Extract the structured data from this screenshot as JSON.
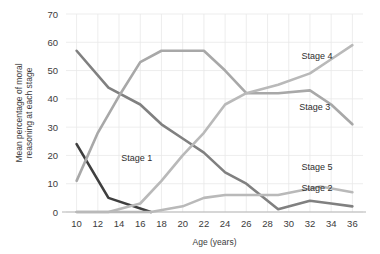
{
  "chart_data": {
    "type": "line",
    "title": "",
    "xlabel": "Age (years)",
    "ylabel": "Mean percentage of moral reasoning at each stage",
    "ylabel_line1": "Mean percentage of moral",
    "ylabel_line2": "reasoning at each stage",
    "x": [
      10,
      12,
      14,
      16,
      18,
      20,
      22,
      24,
      26,
      28,
      30,
      32,
      34,
      36
    ],
    "xlim": [
      9,
      37
    ],
    "ylim": [
      0,
      70
    ],
    "yticks": [
      0,
      10,
      20,
      30,
      40,
      50,
      60,
      70
    ],
    "xticks": [
      10,
      12,
      14,
      16,
      18,
      20,
      22,
      24,
      26,
      28,
      30,
      32,
      34,
      36
    ],
    "grid": true,
    "legend_position": "inline-right",
    "series": [
      {
        "name": "Stage 1",
        "color": "#3f3f3f",
        "label_x": 14.2,
        "label_y": 19,
        "x": [
          10,
          13,
          17
        ],
        "values": [
          24,
          5,
          0
        ]
      },
      {
        "name": "Stage 2",
        "color": "#808080",
        "label_x": 31.2,
        "label_y": 8.5,
        "x": [
          10,
          13,
          16,
          18,
          20,
          22,
          24,
          26,
          29,
          32,
          34,
          36
        ],
        "values": [
          57,
          44,
          38,
          31,
          26,
          21,
          14,
          10,
          1,
          4,
          3,
          2
        ]
      },
      {
        "name": "Stage 3",
        "color": "#a8a8a8",
        "label_x": 31.0,
        "label_y": 37,
        "x": [
          10,
          12,
          14,
          16,
          18,
          20,
          22,
          24,
          26,
          29,
          32,
          34,
          36
        ],
        "values": [
          11,
          28,
          41,
          53,
          57,
          57,
          57,
          50,
          42,
          42,
          43,
          38,
          31
        ]
      },
      {
        "name": "Stage 4",
        "color": "#b9b9b9",
        "label_x": 31.2,
        "label_y": 55,
        "x": [
          10,
          13,
          16,
          18,
          20,
          22,
          24,
          26,
          29,
          32,
          34,
          36
        ],
        "values": [
          0,
          0,
          3,
          11,
          20,
          28,
          38,
          42,
          45,
          49,
          54,
          59
        ]
      },
      {
        "name": "Stage 5",
        "color": "#b9b9b9",
        "label_x": 31.2,
        "label_y": 16,
        "x": [
          10,
          14,
          17,
          20,
          22,
          24,
          26,
          29,
          33,
          36
        ],
        "values": [
          0,
          0,
          0,
          2,
          5,
          6,
          6,
          6,
          9,
          7
        ]
      }
    ]
  }
}
